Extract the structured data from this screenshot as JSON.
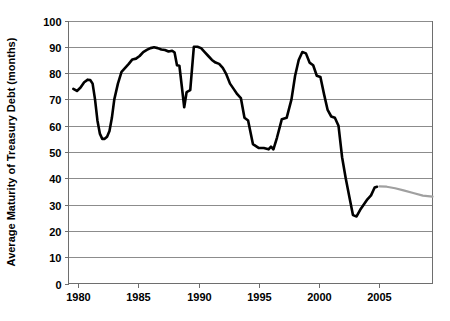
{
  "chart_data": {
    "type": "line",
    "title": "",
    "xlabel": "",
    "ylabel": "Average Maturity of Treasury Debt (months)",
    "xlim": [
      1979.2,
      2009.4
    ],
    "ylim": [
      0,
      100
    ],
    "ytick_labels": [
      "100",
      "90",
      "80",
      "70",
      "60",
      "50",
      "40",
      "30",
      "20",
      "10",
      "0"
    ],
    "yticks": [
      100,
      90,
      80,
      70,
      60,
      50,
      40,
      30,
      20,
      10,
      0
    ],
    "xtick_labels": [
      "1980",
      "1985",
      "1990",
      "1995",
      "2000",
      "2005"
    ],
    "xticks": [
      1980,
      1985,
      1990,
      1995,
      2000,
      2005
    ],
    "grid": "horizontal",
    "legend": "none",
    "series": [
      {
        "name": "Average maturity of Treasury debt (actual)",
        "color": "#000000",
        "style": "solid",
        "x": [
          1979.6,
          1979.9,
          1980.2,
          1980.5,
          1980.8,
          1981.0,
          1981.2,
          1981.4,
          1981.6,
          1981.8,
          1982.0,
          1982.2,
          1982.4,
          1982.6,
          1982.8,
          1983.0,
          1983.3,
          1983.6,
          1983.9,
          1984.2,
          1984.5,
          1984.8,
          1985.1,
          1985.4,
          1985.7,
          1986.0,
          1986.3,
          1986.6,
          1986.9,
          1987.2,
          1987.5,
          1987.8,
          1988.0,
          1988.2,
          1988.4,
          1988.6,
          1988.8,
          1989.0,
          1989.3,
          1989.6,
          1989.9,
          1990.2,
          1990.5,
          1990.8,
          1991.1,
          1991.4,
          1991.7,
          1992.0,
          1992.3,
          1992.6,
          1992.9,
          1993.2,
          1993.5,
          1993.8,
          1994.1,
          1994.5,
          1995.0,
          1995.4,
          1995.8,
          1996.0,
          1996.2,
          1996.5,
          1996.9,
          1997.3,
          1997.7,
          1998.0,
          1998.3,
          1998.6,
          1998.9,
          1999.2,
          1999.5,
          1999.8,
          2000.1,
          2000.4,
          2000.7,
          2001.0,
          2001.3,
          2001.6,
          2001.9,
          2002.2,
          2002.5,
          2002.8,
          2003.1,
          2003.4,
          2003.7,
          2004.0,
          2004.3,
          2004.6,
          2004.8
        ],
        "y": [
          74.0,
          73.2,
          74.5,
          76.5,
          77.5,
          77.4,
          76.0,
          70.0,
          62.0,
          57.0,
          55.0,
          55.0,
          55.8,
          58.0,
          63.0,
          70.0,
          76.0,
          80.5,
          82.0,
          83.5,
          85.2,
          85.5,
          86.5,
          88.0,
          88.8,
          89.5,
          89.8,
          89.5,
          89.0,
          88.8,
          88.2,
          88.5,
          87.8,
          83.0,
          82.8,
          75.0,
          67.0,
          72.8,
          73.5,
          90.0,
          90.0,
          89.5,
          88.0,
          86.5,
          85.0,
          84.0,
          83.5,
          82.0,
          79.5,
          76.0,
          74.0,
          72.0,
          70.5,
          63.0,
          62.0,
          53.0,
          51.5,
          51.5,
          51.0,
          52.0,
          51.0,
          55.5,
          62.5,
          63.0,
          70.0,
          79.0,
          85.0,
          88.0,
          87.5,
          84.0,
          83.0,
          79.0,
          78.5,
          72.0,
          66.0,
          63.5,
          63.0,
          60.0,
          48.0,
          40.0,
          33.0,
          26.0,
          25.5,
          28.0,
          30.0,
          32.0,
          33.5,
          36.5,
          36.8
        ]
      },
      {
        "name": "Projected average maturity",
        "color": "#a0a0a0",
        "style": "solid",
        "x": [
          2005.0,
          2005.6,
          2006.3,
          2007.0,
          2007.8,
          2008.6,
          2009.4
        ],
        "y": [
          36.9,
          36.8,
          36.2,
          35.4,
          34.4,
          33.4,
          33.0
        ]
      }
    ]
  }
}
